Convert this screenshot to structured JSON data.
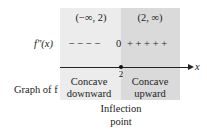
{
  "figure": {
    "intervals": [
      {
        "label": "(−∞, 2)",
        "shade": "#ececec"
      },
      {
        "label": "(2, ∞)",
        "shade": "#dadada"
      }
    ],
    "row_label_second_derivative": "f″(x)",
    "sign_row": {
      "negative_signs": "− − − −",
      "zero": "0",
      "positive_signs": "+ + + + +"
    },
    "axis": {
      "variable_label": "x",
      "point_label": "2"
    },
    "row_label_graph": "Graph of f",
    "concavity": [
      {
        "line1": "Concave",
        "line2": "downward"
      },
      {
        "line1": "Concave",
        "line2": "upward"
      }
    ],
    "annotation": {
      "line1": "Inflection",
      "line2": "point"
    }
  }
}
